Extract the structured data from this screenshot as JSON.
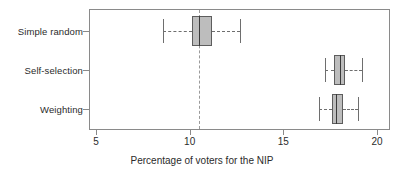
{
  "chart_data": {
    "type": "box",
    "title": "",
    "subtitle": "",
    "xlabel": "Percentage of voters for the NIP",
    "ylabel": "",
    "orientation": "horizontal",
    "xlim": [
      4.0,
      20.7
    ],
    "xticks": [
      5,
      10,
      15,
      20
    ],
    "xticklabels": [
      "5",
      "10",
      "15",
      "20"
    ],
    "grid": false,
    "legend": null,
    "reference_line": {
      "value": 10.5,
      "style": "dashed",
      "color": "#9a9a9a"
    },
    "categories": [
      "Simple random",
      "Self-selection",
      "Weighting"
    ],
    "boxes": [
      {
        "label": "Simple random",
        "whisker_low": 8.6,
        "q1": 10.1,
        "median": 10.5,
        "q3": 11.2,
        "whisker_high": 12.7,
        "fill": "#bdbdbd",
        "edge": "#5d5d5d"
      },
      {
        "label": "Self-selection",
        "whisker_low": 17.2,
        "q1": 17.7,
        "median": 18.0,
        "q3": 18.3,
        "whisker_high": 19.2,
        "fill": "#bdbdbd",
        "edge": "#5d5d5d"
      },
      {
        "label": "Weighting",
        "whisker_low": 16.9,
        "q1": 17.6,
        "median": 17.8,
        "q3": 18.2,
        "whisker_high": 19.0,
        "fill": "#bdbdbd",
        "edge": "#5d5d5d"
      }
    ]
  },
  "layout": {
    "plot_left": 89,
    "plot_top": 9,
    "plot_width": 301,
    "plot_height": 121,
    "x5_px": 96,
    "x20_px": 377,
    "row_y": [
      31,
      70,
      109
    ],
    "box_half_height": 15,
    "frame_color": "#8a8a8a"
  }
}
